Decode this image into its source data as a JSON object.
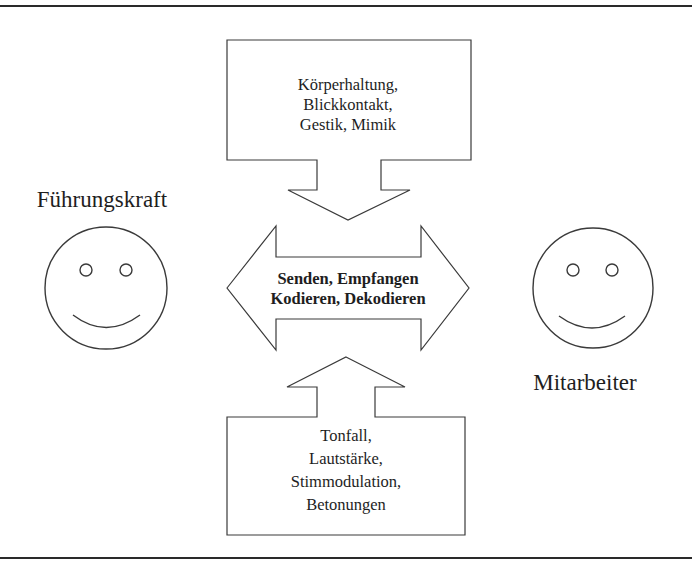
{
  "diagram": {
    "left_person": {
      "label": "Führungskraft",
      "icon": "smiley-face-icon"
    },
    "right_person": {
      "label": "Mitarbeiter",
      "icon": "smiley-face-icon"
    },
    "center_arrow": {
      "direction": "bidirectional",
      "lines": [
        "Senden, Empfangen",
        "Kodieren, Dekodieren"
      ]
    },
    "top_callout": {
      "direction": "down",
      "lines": [
        "Körperhaltung,",
        "Blickkontakt,",
        "Gestik, Mimik"
      ]
    },
    "bottom_callout": {
      "direction": "up",
      "lines": [
        "Tonfall,",
        "Lautstärke,",
        "Stimmodulation,",
        "Betonungen"
      ]
    },
    "colors": {
      "stroke": "#3a3a3a",
      "background": "#ffffff",
      "text": "#1e1e1e"
    }
  }
}
